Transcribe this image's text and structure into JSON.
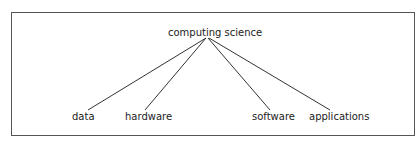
{
  "diagram": {
    "type": "tree",
    "root": {
      "label": "computing science"
    },
    "children": [
      {
        "label": "data"
      },
      {
        "label": "hardware"
      },
      {
        "label": "software"
      },
      {
        "label": "applications"
      }
    ]
  },
  "colors": {
    "line": "#333333",
    "border": "#555555",
    "text": "#222222"
  }
}
